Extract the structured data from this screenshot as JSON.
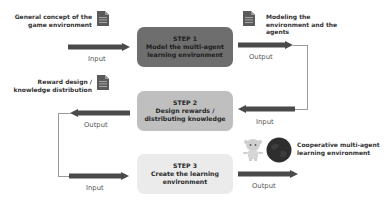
{
  "colors": {
    "step1_fill": "#6e6e6e",
    "step2_fill": "#bfbfbf",
    "step3_fill": "#ebebeb",
    "arrow": "#4a4a4a",
    "connector": "#9a9a9a"
  },
  "steps": [
    {
      "number": "STEP 1",
      "title_line1": "Model the multi-agent",
      "title_line2": "learning environment"
    },
    {
      "number": "STEP 2",
      "title_line1": "Design rewards /",
      "title_line2": "distributing knowledge"
    },
    {
      "number": "STEP 3",
      "title_line1": "Create the learning",
      "title_line2": "environment"
    }
  ],
  "artifacts": {
    "step1_input": {
      "line1": "General concept of the",
      "line2": "game environment",
      "icon": "document-icon"
    },
    "step1_output": {
      "line1": "Modeling the",
      "line2": "environment and the",
      "line3": "agents",
      "icon": "document-icon"
    },
    "step2_output": {
      "line1": "Reward design /",
      "line2": "knowledge distribution",
      "icon": "document-icon"
    },
    "step3_output": {
      "line1": "Cooperative multi-agent",
      "line2": "learning environment",
      "icons": [
        "robot-agent-icon",
        "globe-icon"
      ]
    }
  },
  "io_labels": {
    "step1_input": "Input",
    "step1_output": "Output",
    "step2_input": "Input",
    "step2_output": "Output",
    "step3_input": "Input",
    "step3_output": "Output"
  }
}
